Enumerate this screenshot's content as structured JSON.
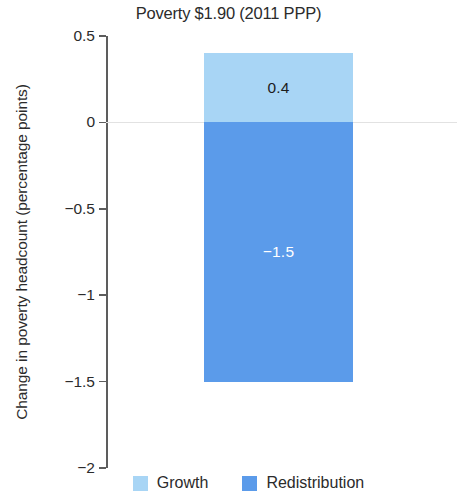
{
  "chart_data": {
    "type": "bar",
    "subtype": "stacked-waterfall-decomposition",
    "title": "Poverty $1.90 (2011 PPP)",
    "xlabel": "",
    "ylabel": "Change in poverty headcount (percentage points)",
    "ylim": [
      -2,
      0.5
    ],
    "ytick_labels": [
      "0.5",
      "0",
      "−0.5",
      "−1",
      "−1.5",
      "−2"
    ],
    "ytick_values": [
      0.5,
      0,
      -0.5,
      -1,
      -1.5,
      -2
    ],
    "grid": false,
    "zero_line": true,
    "categories": [
      ""
    ],
    "legend_position": "bottom",
    "series": [
      {
        "name": "Growth",
        "values": [
          0.4
        ],
        "data_labels": [
          "0.4"
        ],
        "color": "#a8d5f5"
      },
      {
        "name": "Redistribution",
        "values": [
          -1.5
        ],
        "data_labels": [
          "−1.5"
        ],
        "color": "#5b9bea"
      }
    ]
  },
  "axis": {
    "ticks": [
      {
        "label": "0.5",
        "value": 0.5
      },
      {
        "label": "0",
        "value": 0
      },
      {
        "label": "−0.5",
        "value": -0.5
      },
      {
        "label": "−1",
        "value": -1
      },
      {
        "label": "−1.5",
        "value": -1.5
      },
      {
        "label": "−2",
        "value": -2
      }
    ],
    "spine_color": "#5d5d5d",
    "zero_line_color": "#e2e2e2"
  },
  "bar": {
    "growth": {
      "label": "0.4",
      "value": 0.4,
      "color": "#a8d5f5"
    },
    "redistribution": {
      "label": "−1.5",
      "value": -1.5,
      "color": "#5b9bea"
    }
  },
  "legend": {
    "items": [
      {
        "label": "Growth",
        "color": "#a8d5f5"
      },
      {
        "label": "Redistribution",
        "color": "#5b9bea"
      }
    ]
  }
}
